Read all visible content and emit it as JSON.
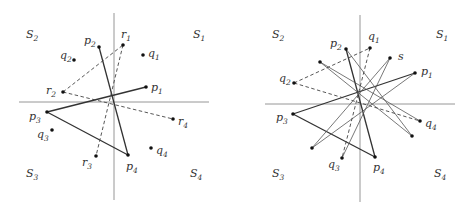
{
  "figure": {
    "left_panel": {
      "axes": {
        "vertical": {
          "x": 114,
          "y1": 13,
          "y2": 200
        },
        "horizontal": {
          "y": 102,
          "x1": 19,
          "x2": 209
        }
      },
      "regions": [
        {
          "id": "S1",
          "base": "S",
          "sub": "1",
          "x": 193,
          "y": 38
        },
        {
          "id": "S2",
          "base": "S",
          "sub": "2",
          "x": 26,
          "y": 38
        },
        {
          "id": "S3",
          "base": "S",
          "sub": "3",
          "x": 26,
          "y": 177
        },
        {
          "id": "S4",
          "base": "S",
          "sub": "4",
          "x": 190,
          "y": 177
        }
      ],
      "points": [
        {
          "id": "p1",
          "base": "p",
          "sub": "1",
          "x": 146,
          "y": 87,
          "lx": 151,
          "ly": 91
        },
        {
          "id": "p2",
          "base": "p",
          "sub": "2",
          "x": 99,
          "y": 47,
          "lx": 84,
          "ly": 44
        },
        {
          "id": "p3",
          "base": "p",
          "sub": "3",
          "x": 47,
          "y": 112,
          "lx": 29,
          "ly": 120
        },
        {
          "id": "p4",
          "base": "p",
          "sub": "4",
          "x": 128,
          "y": 155,
          "lx": 126,
          "ly": 170
        },
        {
          "id": "q1",
          "base": "q",
          "sub": "1",
          "x": 143,
          "y": 55,
          "lx": 148,
          "ly": 57
        },
        {
          "id": "q2",
          "base": "q",
          "sub": "2",
          "x": 74,
          "y": 60,
          "lx": 60,
          "ly": 59
        },
        {
          "id": "q3",
          "base": "q",
          "sub": "3",
          "x": 52,
          "y": 130,
          "lx": 37,
          "ly": 138
        },
        {
          "id": "q4",
          "base": "q",
          "sub": "4",
          "x": 151,
          "y": 148,
          "lx": 156,
          "ly": 154
        },
        {
          "id": "r1",
          "base": "r",
          "sub": "1",
          "x": 123,
          "y": 45,
          "lx": 121,
          "ly": 38
        },
        {
          "id": "r2",
          "base": "r",
          "sub": "2",
          "x": 63,
          "y": 92,
          "lx": 46,
          "ly": 94
        },
        {
          "id": "r3",
          "base": "r",
          "sub": "3",
          "x": 96,
          "y": 156,
          "lx": 82,
          "ly": 166
        },
        {
          "id": "r4",
          "base": "r",
          "sub": "4",
          "x": 173,
          "y": 119,
          "lx": 178,
          "ly": 125
        }
      ],
      "solid_lines": [
        {
          "from": [
            146,
            87
          ],
          "to": [
            47,
            112
          ]
        },
        {
          "from": [
            47,
            112
          ],
          "to": [
            128,
            155
          ]
        },
        {
          "from": [
            128,
            155
          ],
          "to": [
            99,
            47
          ]
        }
      ],
      "dashed_lines": [
        {
          "from": [
            63,
            92
          ],
          "to": [
            123,
            45
          ]
        },
        {
          "from": [
            123,
            45
          ],
          "to": [
            96,
            156
          ]
        },
        {
          "from": [
            63,
            92
          ],
          "to": [
            173,
            119
          ]
        }
      ]
    },
    "right_panel": {
      "axes": {
        "vertical": {
          "x": 360,
          "y1": 15,
          "y2": 202
        },
        "horizontal": {
          "y": 104,
          "x1": 265,
          "x2": 455
        }
      },
      "regions": [
        {
          "id": "S1",
          "base": "S",
          "sub": "1",
          "x": 436,
          "y": 38
        },
        {
          "id": "S2",
          "base": "S",
          "sub": "2",
          "x": 272,
          "y": 38
        },
        {
          "id": "S3",
          "base": "S",
          "sub": "3",
          "x": 272,
          "y": 177
        },
        {
          "id": "S4",
          "base": "S",
          "sub": "4",
          "x": 434,
          "y": 177
        }
      ],
      "points": [
        {
          "id": "p1",
          "base": "p",
          "sub": "1",
          "x": 415,
          "y": 73,
          "lx": 421,
          "ly": 75
        },
        {
          "id": "p2",
          "base": "p",
          "sub": "2",
          "x": 346,
          "y": 49,
          "lx": 330,
          "ly": 47
        },
        {
          "id": "p3",
          "base": "p",
          "sub": "3",
          "x": 293,
          "y": 114,
          "lx": 276,
          "ly": 121
        },
        {
          "id": "p4",
          "base": "p",
          "sub": "4",
          "x": 375,
          "y": 157,
          "lx": 373,
          "ly": 171
        },
        {
          "id": "q1",
          "base": "q",
          "sub": "1",
          "x": 370,
          "y": 48,
          "lx": 368,
          "ly": 40
        },
        {
          "id": "q2",
          "base": "q",
          "sub": "2",
          "x": 294,
          "y": 83,
          "lx": 279,
          "ly": 82
        },
        {
          "id": "q3",
          "base": "q",
          "sub": "3",
          "x": 342,
          "y": 158,
          "lx": 328,
          "ly": 168
        },
        {
          "id": "q4",
          "base": "q",
          "sub": "4",
          "x": 420,
          "y": 121,
          "lx": 425,
          "ly": 127
        },
        {
          "id": "s",
          "base": "s",
          "sub": "",
          "x": 390,
          "y": 58,
          "lx": 398,
          "ly": 60
        },
        {
          "id": "a",
          "base": "",
          "sub": "",
          "x": 312,
          "y": 148,
          "lx": null,
          "ly": null
        },
        {
          "id": "b",
          "base": "",
          "sub": "",
          "x": 320,
          "y": 62,
          "lx": null,
          "ly": null
        },
        {
          "id": "c",
          "base": "",
          "sub": "",
          "x": 412,
          "y": 136,
          "lx": null,
          "ly": null
        }
      ],
      "thick_lines": [
        {
          "from": [
            415,
            73
          ],
          "to": [
            293,
            114
          ]
        },
        {
          "from": [
            293,
            114
          ],
          "to": [
            375,
            157
          ]
        },
        {
          "from": [
            375,
            157
          ],
          "to": [
            346,
            49
          ]
        }
      ],
      "thin_lines": [
        {
          "from": [
            390,
            58
          ],
          "to": [
            312,
            148
          ]
        },
        {
          "from": [
            390,
            58
          ],
          "to": [
            342,
            158
          ]
        },
        {
          "from": [
            415,
            73
          ],
          "to": [
            312,
            148
          ]
        },
        {
          "from": [
            320,
            62
          ],
          "to": [
            420,
            121
          ]
        },
        {
          "from": [
            320,
            62
          ],
          "to": [
            412,
            136
          ]
        },
        {
          "from": [
            346,
            49
          ],
          "to": [
            412,
            136
          ]
        }
      ],
      "dashed_lines": [
        {
          "from": [
            294,
            83
          ],
          "to": [
            370,
            48
          ]
        },
        {
          "from": [
            370,
            48
          ],
          "to": [
            342,
            158
          ]
        },
        {
          "from": [
            294,
            83
          ],
          "to": [
            420,
            121
          ]
        }
      ]
    }
  }
}
